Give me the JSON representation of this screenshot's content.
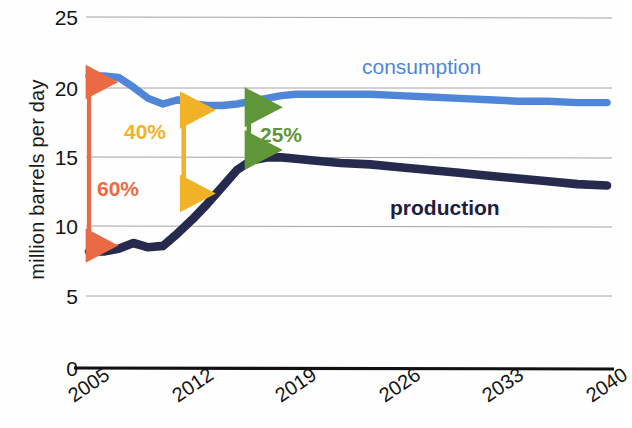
{
  "chart_data": {
    "type": "line",
    "title": "",
    "xlabel": "",
    "ylabel": "million barrels per day",
    "xlim": [
      2005,
      2040
    ],
    "ylim": [
      0,
      25
    ],
    "yticks": [
      0,
      5,
      10,
      15,
      20,
      25
    ],
    "ytick_labels": [
      "0",
      "5",
      "10",
      "15",
      "20",
      "25"
    ],
    "xticks": [
      2005,
      2012,
      2019,
      2026,
      2033,
      2040
    ],
    "xtick_labels": [
      "2005",
      "2012",
      "2019",
      "2026",
      "2033",
      "2040"
    ],
    "grid": "horizontal",
    "legend_position": "inline-labels",
    "x": [
      2005,
      2006,
      2007,
      2008,
      2009,
      2010,
      2011,
      2012,
      2013,
      2014,
      2015,
      2016,
      2017,
      2018,
      2019,
      2020,
      2022,
      2024,
      2026,
      2028,
      2030,
      2032,
      2034,
      2036,
      2038,
      2040
    ],
    "series": [
      {
        "name": "consumption",
        "color": "#4f86d8",
        "values": [
          20.8,
          20.8,
          20.7,
          20.0,
          19.2,
          18.8,
          19.1,
          18.8,
          18.7,
          18.7,
          18.8,
          19.0,
          19.2,
          19.4,
          19.5,
          19.5,
          19.5,
          19.5,
          19.4,
          19.3,
          19.2,
          19.1,
          19.0,
          19.0,
          18.9,
          18.9
        ]
      },
      {
        "name": "production",
        "color": "#262a4d",
        "values": [
          8.3,
          8.3,
          8.5,
          8.9,
          8.6,
          8.7,
          9.6,
          10.6,
          11.7,
          12.9,
          14.1,
          14.8,
          15.0,
          15.0,
          14.9,
          14.8,
          14.6,
          14.5,
          14.3,
          14.1,
          13.9,
          13.7,
          13.5,
          13.3,
          13.1,
          13.0
        ]
      }
    ],
    "series_labels": [
      {
        "text": "consumption",
        "color": "#4f86d8",
        "x": 2027.5,
        "y": 21.3
      },
      {
        "text": "production",
        "color": "#1c2040",
        "x": 2029.0,
        "y": 12.3
      }
    ],
    "annotations": [
      {
        "id": "gap-2005",
        "text": "60%",
        "color": "#ea6a46",
        "x": 2005.0,
        "y_top": 20.8,
        "y_bottom": 8.3,
        "label_x": 2005.8,
        "label_y": 11.9
      },
      {
        "id": "gap-2012",
        "text": "40%",
        "color": "#f2b227",
        "x": 2011.4,
        "y_top": 18.8,
        "y_bottom": 12.0,
        "label_x": 2007.2,
        "label_y": 16.8
      },
      {
        "id": "gap-2016",
        "text": "25%",
        "color": "#5e9638",
        "x": 2015.8,
        "y_top": 19.0,
        "y_bottom": 15.1,
        "label_x": 2017.3,
        "label_y": 16.6
      }
    ]
  },
  "axis": {
    "y_title": "million barrels per day"
  }
}
